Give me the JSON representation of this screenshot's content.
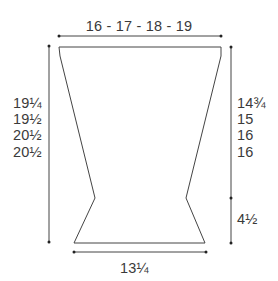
{
  "diagram": {
    "type": "knitting schematic",
    "shape": "garment-panel",
    "line_color": "#444444",
    "top_width_label": "16 - 17 - 18 - 19",
    "bottom_width_label": "13¼",
    "left_length_labels": [
      "19¼",
      "19½",
      "20½",
      "20½"
    ],
    "right_upper_labels": [
      "14¾",
      "15",
      "16",
      "16"
    ],
    "right_lower_label": "4½"
  }
}
